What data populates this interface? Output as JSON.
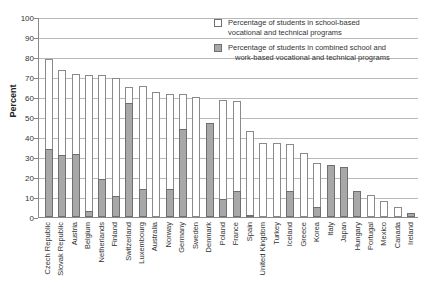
{
  "chart_data": {
    "type": "bar",
    "stacked": true,
    "title": "",
    "subtitle": "",
    "xlabel": "",
    "ylabel": "Percent",
    "ylim": [
      0,
      100
    ],
    "ytick_step": 10,
    "yticks": [
      0,
      10,
      20,
      30,
      40,
      50,
      60,
      70,
      80,
      90,
      100
    ],
    "grid": true,
    "legend_position": "top-right",
    "categories": [
      "Czech Republic",
      "Slovak Republic",
      "Austria",
      "Belgium",
      "Netherlands",
      "Finland",
      "Switzerland",
      "Luxembourg",
      "Australia",
      "Norway",
      "Germany",
      "Sweden",
      "Denmark",
      "Poland",
      "France",
      "Spain",
      "United Kingdom",
      "Turkey",
      "Iceland",
      "Greece",
      "Korea",
      "Italy",
      "Japan",
      "Hungary",
      "Portugal",
      "Mexico",
      "Canada",
      "Ireland"
    ],
    "series": [
      {
        "name": "Percentage of students in school-based vocational and technical programs",
        "color": "#ffffff",
        "values": [
          45,
          42.5,
          40,
          68,
          52,
          59,
          8,
          51.5,
          62.5,
          47.5,
          17.5,
          60,
          0,
          49.5,
          45,
          42,
          37,
          37,
          23.5,
          32,
          22,
          0,
          0,
          0,
          11,
          8,
          5,
          0
        ]
      },
      {
        "name": "Percentage of students in combined school and work-based vocational and technical programs",
        "color": "#a8a8a8",
        "values": [
          34,
          31,
          31.5,
          3,
          19,
          10.5,
          57,
          14,
          0,
          14,
          44,
          0,
          47,
          9,
          13,
          1,
          0,
          0,
          13,
          0,
          5,
          26,
          25,
          13,
          0,
          0,
          0,
          2
        ]
      }
    ],
    "totals": [
      79,
      73.5,
      71.5,
      71,
      71,
      69.5,
      65,
      65.5,
      62.5,
      61.5,
      61.5,
      60,
      47,
      58.5,
      58,
      43,
      37,
      37,
      36.5,
      32,
      27,
      26,
      25,
      13,
      11,
      8,
      5,
      2
    ]
  },
  "legend": {
    "items": [
      {
        "swatch": "white",
        "line1": "Percentage of students in school-based",
        "line2": "vocational and technical programs"
      },
      {
        "swatch": "gray",
        "line1": "Percentage of students in combined school and",
        "line2": "work-based vocational and technical programs"
      }
    ]
  }
}
